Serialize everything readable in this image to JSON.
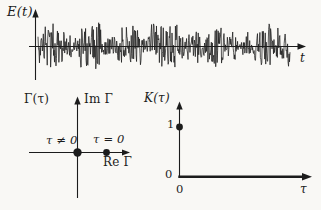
{
  "figure": {
    "colors": {
      "background": "#f9f8f5",
      "ink": "#1c1c1c"
    },
    "field_plot": {
      "ylabel": "E(t)",
      "xlabel": "t"
    },
    "gamma_plot": {
      "title": "Γ(τ)",
      "im_axis_label": "Im Γ",
      "re_axis_label": "Re Γ",
      "origin_point_label": "τ ≠ 0",
      "real_axis_point_label": "τ = 0",
      "points": [
        {
          "label": "τ ≠ 0",
          "re": 0,
          "im": 0
        },
        {
          "label": "τ = 0",
          "re": 1,
          "im": 0
        }
      ]
    },
    "k_plot": {
      "title": "K(τ)",
      "xlabel": "τ",
      "y_tick_one": "1",
      "y_tick_zero": "0",
      "x_tick_zero": "0",
      "points": [
        {
          "tau": 0,
          "K": 1
        }
      ]
    },
    "noise": {
      "seed": 987654321,
      "points": 520,
      "x_start": 38,
      "x_end": 290,
      "baseline": 46.5,
      "max_amplitude": 24
    }
  }
}
